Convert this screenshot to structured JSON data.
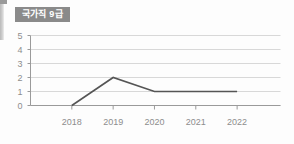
{
  "badge": {
    "label": "국가직 9급",
    "background_color": "#8a8a8a",
    "text_color": "#ffffff"
  },
  "colors": {
    "background": "#fdfdfd",
    "gridline": "#d8d8d8",
    "axis": "#9a9a9a",
    "line": "#555555",
    "tick_label": "#8d8d8d"
  },
  "chart_data": {
    "type": "line",
    "title": "국가직 9급",
    "xlabel": "",
    "ylabel": "",
    "categories": [
      "2018",
      "2019",
      "2020",
      "2021",
      "2022"
    ],
    "values": [
      0,
      2,
      1,
      1,
      1
    ],
    "series": [
      {
        "name": "국가직 9급",
        "values": [
          0,
          2,
          1,
          1,
          1
        ]
      }
    ],
    "ylim": [
      0,
      5
    ],
    "yticks": [
      0,
      1,
      2,
      3,
      4,
      5
    ],
    "ytick_labels": [
      "0",
      "1",
      "2",
      "3",
      "4",
      "5"
    ],
    "xtick_labels": [
      "2018",
      "2019",
      "2020",
      "2021",
      "2022"
    ],
    "grid": true,
    "grid_axis": "y",
    "legend": false,
    "markers": false,
    "line_color": "#555555",
    "line_width": 1.6
  }
}
